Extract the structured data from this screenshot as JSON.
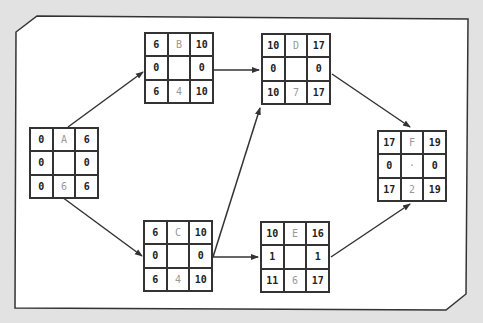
{
  "diagram": {
    "type": "activity-on-node network",
    "frame": {
      "background": "#ffffff",
      "page_background": "#e2e2e2",
      "stroke": "#333333"
    },
    "nodes": [
      {
        "id": "A",
        "x": 29,
        "y": 127,
        "es": "0",
        "name": "A",
        "ef": "6",
        "ts_left": "0",
        "center": "",
        "ts_right": "0",
        "ls": "0",
        "duration": "6",
        "lf": "6"
      },
      {
        "id": "B",
        "x": 144,
        "y": 32,
        "es": "6",
        "name": "B",
        "ef": "10",
        "ts_left": "0",
        "center": "",
        "ts_right": "0",
        "ls": "6",
        "duration": "4",
        "lf": "10"
      },
      {
        "id": "C",
        "x": 143,
        "y": 220,
        "es": "6",
        "name": "C",
        "ef": "10",
        "ts_left": "0",
        "center": "",
        "ts_right": "0",
        "ls": "6",
        "duration": "4",
        "lf": "10"
      },
      {
        "id": "D",
        "x": 261,
        "y": 33,
        "es": "10",
        "name": "D",
        "ef": "17",
        "ts_left": "0",
        "center": "",
        "ts_right": "0",
        "ls": "10",
        "duration": "7",
        "lf": "17"
      },
      {
        "id": "E",
        "x": 260,
        "y": 221,
        "es": "10",
        "name": "E",
        "ef": "16",
        "ts_left": "1",
        "center": "",
        "ts_right": "1",
        "ls": "11",
        "duration": "6",
        "lf": "17"
      },
      {
        "id": "F",
        "x": 377,
        "y": 130,
        "es": "17",
        "name": "F",
        "ef": "19",
        "ts_left": "0",
        "center": "·",
        "ts_right": "0",
        "ls": "17",
        "duration": "2",
        "lf": "19"
      }
    ],
    "edges": [
      {
        "from": "A",
        "to": "B",
        "x1": 68,
        "y1": 127,
        "x2": 143,
        "y2": 72
      },
      {
        "from": "A",
        "to": "C",
        "x1": 62,
        "y1": 197,
        "x2": 142,
        "y2": 256
      },
      {
        "from": "B",
        "to": "D",
        "x1": 214,
        "y1": 70,
        "x2": 259,
        "y2": 70
      },
      {
        "from": "C",
        "to": "D",
        "x1": 213,
        "y1": 257,
        "x2": 260,
        "y2": 108
      },
      {
        "from": "C",
        "to": "E",
        "x1": 213,
        "y1": 257,
        "x2": 258,
        "y2": 257
      },
      {
        "from": "D",
        "to": "F",
        "x1": 332,
        "y1": 74,
        "x2": 410,
        "y2": 127
      },
      {
        "from": "E",
        "to": "F",
        "x1": 331,
        "y1": 257,
        "x2": 410,
        "y2": 204
      }
    ]
  }
}
